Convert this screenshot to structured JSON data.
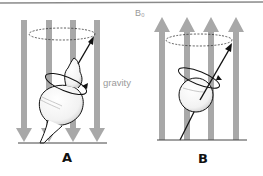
{
  "figure": {
    "panels": [
      {
        "id": "A",
        "label": "A",
        "description": "spinning top precessing under gravity",
        "field_direction": "down",
        "force_label": "gravity"
      },
      {
        "id": "B",
        "label": "B",
        "description": "nuclear spin precessing in magnetic field",
        "field_direction": "up",
        "field_label": "B₀"
      }
    ],
    "colors": {
      "field_arrow": "#a8a8a8",
      "outline": "#111111",
      "label_gray": "#9a9a9a",
      "top_border": "#8a8a8a"
    }
  }
}
